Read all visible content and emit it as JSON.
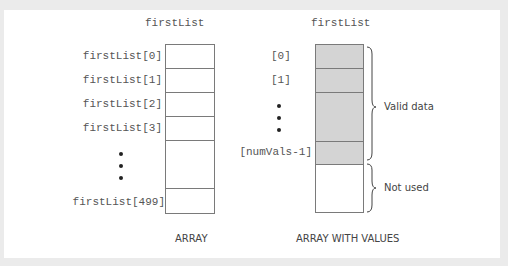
{
  "left_diagram": {
    "title": "firstList",
    "labels": [
      "firstList[0]",
      "firstList[1]",
      "firstList[2]",
      "firstList[3]",
      "firstList[499]"
    ],
    "caption": "ARRAY"
  },
  "right_diagram": {
    "title": "firstList",
    "labels": [
      "[0]",
      "[1]",
      "[numVals-1]"
    ],
    "brace_valid": "Valid data",
    "brace_unused": "Not used",
    "caption": "ARRAY WITH VALUES"
  },
  "colors": {
    "background": "#ebebeb",
    "panel": "#ffffff",
    "filled_cell": "#d4d4d4",
    "border": "#7a7a7a"
  }
}
